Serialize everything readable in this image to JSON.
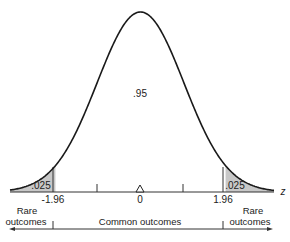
{
  "chart_data": {
    "type": "area",
    "title": "",
    "distribution": "standard normal",
    "xlabel": "z",
    "ylabel": "",
    "x_ticks": [
      {
        "value": -1.96,
        "label": "-1.96"
      },
      {
        "value": -1.0,
        "label": ""
      },
      {
        "value": 0,
        "label": "0"
      },
      {
        "value": 1.0,
        "label": ""
      },
      {
        "value": 1.96,
        "label": "1.96"
      }
    ],
    "regions": [
      {
        "name": "left-tail",
        "from": "-inf",
        "to": -1.96,
        "area": 0.025,
        "label": ".025",
        "shaded": true
      },
      {
        "name": "center",
        "from": -1.96,
        "to": 1.96,
        "area": 0.95,
        "label": ".95",
        "shaded": false
      },
      {
        "name": "right-tail",
        "from": 1.96,
        "to": "inf",
        "area": 0.025,
        "label": ".025",
        "shaded": true
      }
    ],
    "annotations": [
      {
        "text": "Rare outcomes",
        "range": [
          "-inf",
          -1.96
        ]
      },
      {
        "text": "Common outcomes",
        "range": [
          -1.96,
          1.96
        ]
      },
      {
        "text": "Rare outcomes",
        "range": [
          1.96,
          "inf"
        ]
      }
    ],
    "mean_marker": {
      "value": 0,
      "shape": "triangle"
    },
    "grid": false,
    "legend": false
  },
  "labels": {
    "center_area": ".95",
    "left_tail_area": ".025",
    "right_tail_area": ".025",
    "left_crit": "-1.96",
    "right_crit": "1.96",
    "zero": "0",
    "axis": "z",
    "rare_line1": "Rare",
    "rare_line2": "outcomes",
    "common": "Common outcomes"
  },
  "colors": {
    "curve": "#1a1a1a",
    "shade": "#c8c8c8",
    "axis": "#333333"
  }
}
